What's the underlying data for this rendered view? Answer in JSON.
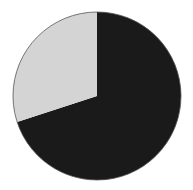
{
  "chart_data": {
    "type": "pie",
    "title": "",
    "categories": [
      "Dark slice",
      "Light slice"
    ],
    "values": [
      70,
      30
    ],
    "colors": [
      "#1a1a1a",
      "#d4d4d4"
    ],
    "start_angle_deg": 0,
    "direction": "clockwise",
    "legend": "none",
    "labels_shown": false
  },
  "layout": {
    "cx": 97,
    "cy": 96,
    "r": 84,
    "outline": "#555555"
  }
}
